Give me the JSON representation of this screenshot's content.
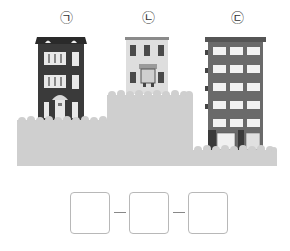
{
  "labels": {
    "a": "㉠",
    "b": "㉡",
    "c": "㉢"
  },
  "buildings": [
    {
      "id": "a",
      "label": "㉠",
      "description": "dark 3-story townhouse with mansard roof, lowest terrain step middle",
      "color": "#3a3a3a"
    },
    {
      "id": "b",
      "label": "㉡",
      "description": "light 2-story building on highest terrain step",
      "color": "#dcdcdc"
    },
    {
      "id": "c",
      "label": "㉢",
      "description": "tall 6-story apartment building on lowest terrain step",
      "color": "#6a6a6a"
    }
  ],
  "terrain_color": "#cfcfcf",
  "answer": {
    "boxes": [
      "",
      "",
      ""
    ],
    "separator": "–"
  }
}
